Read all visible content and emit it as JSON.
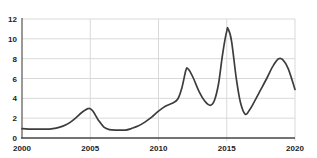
{
  "chart_data": {
    "type": "line",
    "title": "",
    "xlabel": "",
    "ylabel": "",
    "xlim": [
      2000,
      2020
    ],
    "ylim": [
      0,
      12
    ],
    "x_ticks": [
      2000,
      2005,
      2010,
      2015,
      2020
    ],
    "y_ticks": [
      0,
      2,
      4,
      6,
      8,
      10,
      12
    ],
    "grid": true,
    "legend": false,
    "colors": {
      "background": "#ffffff",
      "grid": "#d9d9d9",
      "axis": "#555555",
      "label": "#1c1c1c",
      "line": "#3d3d3d"
    },
    "series": [
      {
        "name": "series-1",
        "color": "#3d3d3d",
        "points": [
          [
            2000,
            0.95
          ],
          [
            2000.5,
            0.9
          ],
          [
            2001,
            0.9
          ],
          [
            2001.5,
            0.9
          ],
          [
            2002,
            0.9
          ],
          [
            2002.5,
            1.0
          ],
          [
            2003,
            1.2
          ],
          [
            2003.5,
            1.55
          ],
          [
            2004,
            2.1
          ],
          [
            2004.4,
            2.6
          ],
          [
            2004.9,
            3.0
          ],
          [
            2005.2,
            2.7
          ],
          [
            2005.6,
            1.8
          ],
          [
            2006,
            1.1
          ],
          [
            2006.4,
            0.85
          ],
          [
            2007,
            0.8
          ],
          [
            2007.6,
            0.8
          ],
          [
            2008,
            0.95
          ],
          [
            2008.5,
            1.2
          ],
          [
            2009,
            1.6
          ],
          [
            2009.5,
            2.1
          ],
          [
            2010,
            2.7
          ],
          [
            2010.5,
            3.2
          ],
          [
            2011,
            3.5
          ],
          [
            2011.4,
            3.9
          ],
          [
            2011.7,
            5.0
          ],
          [
            2012,
            6.8
          ],
          [
            2012.15,
            7.0
          ],
          [
            2012.5,
            6.2
          ],
          [
            2013,
            4.6
          ],
          [
            2013.4,
            3.7
          ],
          [
            2013.8,
            3.3
          ],
          [
            2014.1,
            3.8
          ],
          [
            2014.4,
            5.5
          ],
          [
            2014.7,
            8.5
          ],
          [
            2015.0,
            10.8
          ],
          [
            2015.1,
            11.0
          ],
          [
            2015.35,
            9.8
          ],
          [
            2015.7,
            6.0
          ],
          [
            2016,
            3.6
          ],
          [
            2016.35,
            2.4
          ],
          [
            2016.7,
            2.9
          ],
          [
            2017,
            3.6
          ],
          [
            2017.5,
            4.9
          ],
          [
            2018,
            6.2
          ],
          [
            2018.4,
            7.3
          ],
          [
            2018.8,
            8.0
          ],
          [
            2019.1,
            7.9
          ],
          [
            2019.5,
            7.0
          ],
          [
            2020,
            4.9
          ]
        ]
      }
    ]
  }
}
